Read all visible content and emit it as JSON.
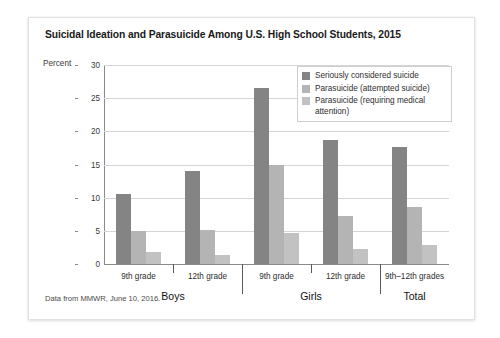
{
  "figure": {
    "title": "Suicidal Ideation and Parasuicide Among U.S. High School Students, 2015",
    "axis_unit_label": "Percent",
    "source_note": "Data from MMWR, June 10, 2016."
  },
  "chart_data": {
    "type": "bar",
    "title": "Suicidal Ideation and Parasuicide Among U.S. High School Students, 2015",
    "xlabel": "",
    "ylabel": "Percent",
    "ylim": [
      0,
      30
    ],
    "yticks": [
      0,
      5,
      10,
      15,
      20,
      25,
      30
    ],
    "grid": true,
    "legend_position": "top-right",
    "groups": [
      {
        "name": "Boys",
        "subgroups": [
          "9th grade",
          "12th grade"
        ]
      },
      {
        "name": "Girls",
        "subgroups": [
          "9th grade",
          "12th grade"
        ]
      },
      {
        "name": "Total",
        "subgroups": [
          "9th–12th grades"
        ]
      }
    ],
    "categories": [
      "Boys 9th grade",
      "Boys 12th grade",
      "Girls 9th grade",
      "Girls 12th grade",
      "Total 9th–12th grades"
    ],
    "series": [
      {
        "name": "Seriously considered suicide",
        "color": "#848484",
        "values": [
          10.6,
          14.0,
          26.5,
          18.7,
          17.7
        ]
      },
      {
        "name": "Parasuicide (attempted suicide)",
        "color": "#b4b4b4",
        "values": [
          5.0,
          5.1,
          15.0,
          7.2,
          8.6
        ]
      },
      {
        "name": "Parasuicide (requiring medical attention)",
        "color": "#c2c2c2",
        "values": [
          1.8,
          1.3,
          4.7,
          2.2,
          2.8
        ]
      }
    ]
  },
  "colors": {
    "series_1": "#848484",
    "series_2": "#b4b4b4",
    "series_3": "#c2c2c2",
    "gridline": "#d5d5d5",
    "axis": "#8a8a8a",
    "card_border": "#e2e2e2",
    "page_background": "#ffffff"
  }
}
